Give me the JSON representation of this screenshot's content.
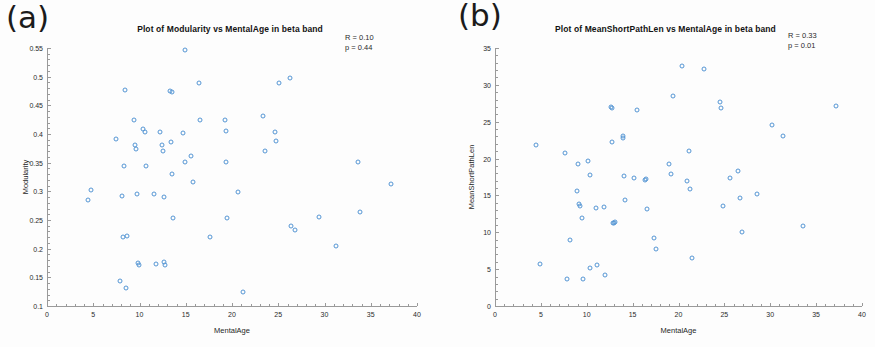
{
  "figure": {
    "background_color": "#fdfdfd",
    "marker_color": "#5596d4",
    "axis_color": "#9a9a9a"
  },
  "panels": [
    {
      "letter": "(a)",
      "stats_r": "R = 0.10",
      "stats_p": "p = 0.44"
    },
    {
      "letter": "(b)",
      "stats_r": "R = 0.33",
      "stats_p": "p = 0.01"
    }
  ],
  "chart_data": [
    {
      "type": "scatter",
      "title": "Plot of Modularity vs MentalAge in beta band",
      "xlabel": "MentalAge",
      "ylabel": "Modularity",
      "xlim": [
        0,
        40
      ],
      "ylim": [
        0.1,
        0.55
      ],
      "xticks": [
        0,
        5,
        10,
        15,
        20,
        25,
        30,
        35,
        40
      ],
      "xticklabels": [
        "0",
        "5",
        "10",
        "15",
        "20",
        "25",
        "30",
        "35",
        "40"
      ],
      "yticks": [
        0.1,
        0.15,
        0.2,
        0.25,
        0.3,
        0.35,
        0.4,
        0.45,
        0.5,
        0.55
      ],
      "yticklabels": [
        "0.1",
        "0.15",
        "0.2",
        "0.25",
        "0.3",
        "0.35",
        "0.4",
        "0.45",
        "0.5",
        "0.55"
      ],
      "grid": false,
      "legend": null,
      "annotations": [
        "R = 0.10",
        "p = 0.44"
      ],
      "correlation_r": 0.1,
      "p_value": 0.44,
      "points": [
        [
          4.4,
          0.285
        ],
        [
          4.8,
          0.303
        ],
        [
          7.5,
          0.391
        ],
        [
          7.9,
          0.143
        ],
        [
          8.1,
          0.291
        ],
        [
          8.2,
          0.221
        ],
        [
          8.3,
          0.345
        ],
        [
          8.4,
          0.477
        ],
        [
          8.5,
          0.131
        ],
        [
          8.6,
          0.222
        ],
        [
          9.4,
          0.425
        ],
        [
          9.5,
          0.38
        ],
        [
          9.6,
          0.374
        ],
        [
          9.7,
          0.296
        ],
        [
          9.8,
          0.175
        ],
        [
          9.9,
          0.172
        ],
        [
          10.4,
          0.408
        ],
        [
          10.6,
          0.403
        ],
        [
          10.7,
          0.345
        ],
        [
          11.6,
          0.296
        ],
        [
          11.8,
          0.173
        ],
        [
          12.2,
          0.404
        ],
        [
          12.4,
          0.381
        ],
        [
          12.5,
          0.37
        ],
        [
          12.6,
          0.29
        ],
        [
          12.7,
          0.176
        ],
        [
          12.8,
          0.172
        ],
        [
          13.3,
          0.475
        ],
        [
          13.5,
          0.473
        ],
        [
          13.4,
          0.386
        ],
        [
          13.5,
          0.33
        ],
        [
          13.6,
          0.253
        ],
        [
          14.9,
          0.547
        ],
        [
          14.7,
          0.402
        ],
        [
          14.9,
          0.351
        ],
        [
          15.6,
          0.362
        ],
        [
          15.8,
          0.316
        ],
        [
          16.5,
          0.425
        ],
        [
          16.4,
          0.489
        ],
        [
          17.6,
          0.221
        ],
        [
          19.2,
          0.425
        ],
        [
          19.3,
          0.405
        ],
        [
          19.4,
          0.351
        ],
        [
          19.5,
          0.253
        ],
        [
          20.7,
          0.299
        ],
        [
          21.2,
          0.125
        ],
        [
          23.4,
          0.432
        ],
        [
          23.6,
          0.371
        ],
        [
          24.6,
          0.404
        ],
        [
          24.8,
          0.388
        ],
        [
          25.1,
          0.489
        ],
        [
          26.3,
          0.497
        ],
        [
          26.4,
          0.24
        ],
        [
          26.8,
          0.233
        ],
        [
          29.4,
          0.256
        ],
        [
          31.2,
          0.204
        ],
        [
          33.6,
          0.352
        ],
        [
          33.8,
          0.264
        ],
        [
          37.2,
          0.313
        ]
      ]
    },
    {
      "type": "scatter",
      "title": "Plot of MeanShortPathLen vs MentalAge in beta band",
      "xlabel": "MentalAge",
      "ylabel": "MeanShortPathLen",
      "xlim": [
        0,
        40
      ],
      "ylim": [
        0,
        35
      ],
      "xticks": [
        0,
        5,
        10,
        15,
        20,
        25,
        30,
        35,
        40
      ],
      "xticklabels": [
        "0",
        "5",
        "10",
        "15",
        "20",
        "25",
        "30",
        "35",
        "40"
      ],
      "yticks": [
        0,
        5,
        10,
        15,
        20,
        25,
        30,
        35
      ],
      "yticklabels": [
        "0",
        "5",
        "10",
        "15",
        "20",
        "25",
        "30",
        "35"
      ],
      "grid": false,
      "legend": null,
      "annotations": [
        "R = 0.33",
        "p = 0.01"
      ],
      "correlation_r": 0.33,
      "p_value": 0.01,
      "points": [
        [
          4.5,
          21.8
        ],
        [
          4.9,
          5.7
        ],
        [
          7.6,
          20.8
        ],
        [
          7.8,
          3.7
        ],
        [
          8.2,
          9.0
        ],
        [
          8.9,
          15.6
        ],
        [
          9.1,
          19.2
        ],
        [
          9.2,
          13.9
        ],
        [
          9.3,
          13.6
        ],
        [
          9.5,
          11.9
        ],
        [
          9.6,
          3.6
        ],
        [
          10.1,
          19.7
        ],
        [
          10.3,
          17.8
        ],
        [
          10.4,
          5.1
        ],
        [
          11.0,
          13.3
        ],
        [
          11.1,
          5.6
        ],
        [
          11.9,
          13.4
        ],
        [
          12.0,
          4.2
        ],
        [
          12.6,
          27.0
        ],
        [
          12.8,
          26.8
        ],
        [
          12.7,
          22.3
        ],
        [
          12.9,
          11.3
        ],
        [
          13.0,
          11.2
        ],
        [
          13.1,
          11.4
        ],
        [
          13.9,
          23.0
        ],
        [
          14.0,
          22.8
        ],
        [
          14.1,
          17.6
        ],
        [
          14.2,
          14.4
        ],
        [
          15.2,
          17.4
        ],
        [
          15.5,
          26.6
        ],
        [
          16.3,
          17.1
        ],
        [
          16.5,
          17.2
        ],
        [
          16.6,
          13.1
        ],
        [
          17.3,
          9.2
        ],
        [
          17.5,
          7.7
        ],
        [
          19.0,
          19.2
        ],
        [
          19.2,
          17.9
        ],
        [
          19.4,
          28.5
        ],
        [
          20.4,
          32.5
        ],
        [
          20.9,
          16.9
        ],
        [
          21.1,
          21.0
        ],
        [
          21.3,
          15.9
        ],
        [
          21.5,
          6.5
        ],
        [
          22.8,
          32.2
        ],
        [
          24.5,
          27.7
        ],
        [
          24.6,
          26.9
        ],
        [
          24.8,
          13.5
        ],
        [
          25.6,
          17.4
        ],
        [
          26.5,
          18.3
        ],
        [
          26.7,
          14.6
        ],
        [
          26.9,
          10.1
        ],
        [
          28.6,
          15.2
        ],
        [
          30.2,
          24.5
        ],
        [
          31.4,
          23.1
        ],
        [
          33.6,
          10.9
        ],
        [
          37.2,
          27.1
        ]
      ]
    }
  ]
}
